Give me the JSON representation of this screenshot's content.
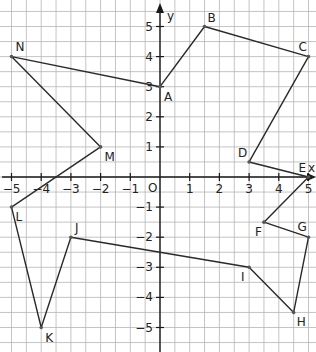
{
  "diagram": {
    "type": "coordinate-plane-polygon",
    "axes": {
      "x_label": "x",
      "y_label": "y",
      "origin_label": "O",
      "x_ticks": [
        -5,
        -4,
        -3,
        -2,
        -1,
        1,
        2,
        3,
        4,
        5
      ],
      "y_ticks": [
        -5,
        -4,
        -3,
        -2,
        -1,
        1,
        2,
        3,
        4,
        5
      ],
      "x_range": [
        -5.4,
        5.2
      ],
      "y_range": [
        -5.8,
        5.9
      ],
      "grid_step": 0.5
    },
    "points": [
      {
        "name": "A",
        "x": 0,
        "y": 3,
        "label_dx": 4,
        "label_dy": 14
      },
      {
        "name": "B",
        "x": 1.5,
        "y": 5,
        "label_dx": 3,
        "label_dy": -5
      },
      {
        "name": "C",
        "x": 5,
        "y": 4,
        "label_dx": -10,
        "label_dy": -6
      },
      {
        "name": "D",
        "x": 3,
        "y": 0.5,
        "label_dx": -11,
        "label_dy": -5
      },
      {
        "name": "E",
        "x": 5,
        "y": 0,
        "label_dx": -10,
        "label_dy": -5
      },
      {
        "name": "F",
        "x": 3.5,
        "y": -1.5,
        "label_dx": -9,
        "label_dy": 14
      },
      {
        "name": "G",
        "x": 5,
        "y": -2,
        "label_dx": -11,
        "label_dy": -6
      },
      {
        "name": "H",
        "x": 4.5,
        "y": -4.5,
        "label_dx": 3,
        "label_dy": 14
      },
      {
        "name": "I",
        "x": 3,
        "y": -3,
        "label_dx": -8,
        "label_dy": 14
      },
      {
        "name": "J",
        "x": -3,
        "y": -2,
        "label_dx": 4,
        "label_dy": -5
      },
      {
        "name": "K",
        "x": -4,
        "y": -5,
        "label_dx": 4,
        "label_dy": 14
      },
      {
        "name": "L",
        "x": -5,
        "y": -1,
        "label_dx": 4,
        "label_dy": 14
      },
      {
        "name": "M",
        "x": -2,
        "y": 1,
        "label_dx": 4,
        "label_dy": 14
      },
      {
        "name": "N",
        "x": -5,
        "y": 4,
        "label_dx": 4,
        "label_dy": -6
      }
    ],
    "polygon_order": [
      "A",
      "B",
      "C",
      "D",
      "E",
      "F",
      "G",
      "H",
      "I",
      "J",
      "K",
      "L",
      "M",
      "N",
      "A"
    ],
    "colors": {
      "grid": "#b5b5b5",
      "axis": "#1a1a1a",
      "line": "#2a2a2a",
      "point": "#555555",
      "background": "#ffffff"
    }
  }
}
